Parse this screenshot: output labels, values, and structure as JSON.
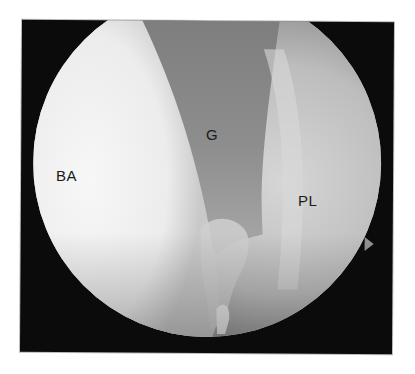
{
  "image": {
    "type": "arthroscopic-view",
    "frame_color": "#0b0b0b",
    "labels": [
      {
        "id": "ba",
        "text": "BA"
      },
      {
        "id": "g",
        "text": "G"
      },
      {
        "id": "pl",
        "text": "PL"
      }
    ],
    "colors": {
      "ba_region": "#efefef",
      "g_region": "#8e8e8e",
      "pl_region": "#c8c8c8",
      "background": "#ffffff"
    }
  }
}
